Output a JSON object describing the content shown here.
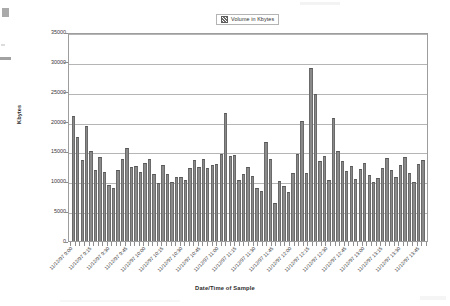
{
  "legend": {
    "label": "Volume in Kbytes",
    "swatch_icon": "hatched-square-swatch",
    "position": "top-center"
  },
  "axis": {
    "y_title": "Kbytes",
    "x_title": "Date/Time of Sample"
  },
  "colors": {
    "bar_fill": "#8a8a8a",
    "bar_outline": "#6a6a6a",
    "gridline": "#a8a8a8",
    "plot_border": "#9d9d9d",
    "background": "#ffffff",
    "text": "#333333"
  },
  "chart_data": {
    "type": "bar",
    "title": "",
    "subtitle": "",
    "xlabel": "Date/Time of Sample",
    "ylabel": "Kbytes",
    "ylim": [
      0,
      35000
    ],
    "ytick_labels": [
      "0",
      "5000",
      "10000",
      "15000",
      "20000",
      "25000",
      "30000",
      "35000"
    ],
    "ytick_values": [
      0,
      5000,
      10000,
      15000,
      20000,
      25000,
      30000,
      35000
    ],
    "grid": true,
    "legend": [
      "Volume in Kbytes"
    ],
    "legend_position": "top-center",
    "xtick_labels": [
      "11/12/97 9:00",
      "11/12/97 9:15",
      "11/12/97 9:30",
      "11/12/97 9:45",
      "11/12/97 10:00",
      "11/12/97 10:15",
      "11/12/97 10:30",
      "11/12/97 10:45",
      "11/12/97 11:00",
      "11/12/97 11:15",
      "11/12/97 11:30",
      "11/12/97 11:45",
      "11/12/97 12:00",
      "11/12/97 12:15",
      "11/12/97 12:30",
      "11/12/97 12:45",
      "11/12/97 13:00",
      "11/12/97 13:15",
      "11/12/97 13:30",
      "11/12/97 13:45"
    ],
    "xtick_every_n_bars": 4,
    "categories": [
      "11/12/97 9:00",
      "11/12/97 9:05",
      "11/12/97 9:10",
      "11/12/97 9:15",
      "11/12/97 9:20",
      "11/12/97 9:25",
      "11/12/97 9:30",
      "11/12/97 9:35",
      "11/12/97 9:40",
      "11/12/97 9:45",
      "11/12/97 9:50",
      "11/12/97 9:55",
      "11/12/97 10:00",
      "11/12/97 10:05",
      "11/12/97 10:10",
      "11/12/97 10:15",
      "11/12/97 10:20",
      "11/12/97 10:25",
      "11/12/97 10:30",
      "11/12/97 10:35",
      "11/12/97 10:40",
      "11/12/97 10:45",
      "11/12/97 10:50",
      "11/12/97 10:55",
      "11/12/97 11:00",
      "11/12/97 11:05",
      "11/12/97 11:10",
      "11/12/97 11:15",
      "11/12/97 11:20",
      "11/12/97 11:25",
      "11/12/97 11:30",
      "11/12/97 11:35",
      "11/12/97 11:40",
      "11/12/97 11:45",
      "11/12/97 11:50",
      "11/12/97 11:55",
      "11/12/97 12:00",
      "11/12/97 12:05",
      "11/12/97 12:10",
      "11/12/97 12:15",
      "11/12/97 12:20",
      "11/12/97 12:25",
      "11/12/97 12:30",
      "11/12/97 12:35",
      "11/12/97 12:40",
      "11/12/97 12:45",
      "11/12/97 12:50",
      "11/12/97 12:55",
      "11/12/97 13:00",
      "11/12/97 13:05",
      "11/12/97 13:10",
      "11/12/97 13:15",
      "11/12/97 13:20",
      "11/12/97 13:25",
      "11/12/97 13:30",
      "11/12/97 13:35",
      "11/12/97 13:40",
      "11/12/97 13:45",
      "11/12/97 13:50",
      "11/12/97 13:55",
      "11/12/97 14:00",
      "11/12/97 14:05",
      "11/12/97 14:10",
      "11/12/97 14:15",
      "11/12/97 14:20",
      "11/12/97 14:25",
      "11/12/97 14:30",
      "11/12/97 14:35",
      "11/12/97 14:40",
      "11/12/97 14:45",
      "11/12/97 14:50",
      "11/12/97 14:55",
      "11/12/97 15:00",
      "11/12/97 15:05",
      "11/12/97 15:10",
      "11/12/97 15:15",
      "11/12/97 15:20",
      "11/12/97 15:25",
      "11/12/97 15:30"
    ],
    "values": [
      21000,
      17500,
      13550,
      19300,
      15000,
      11850,
      14100,
      11500,
      9300,
      8900,
      11900,
      13800,
      15650,
      12400,
      12550,
      11600,
      13050,
      13800,
      11200,
      9650,
      12750,
      11300,
      9900,
      10700,
      10800,
      10300,
      12150,
      13650,
      12400,
      13700,
      12200,
      12800,
      12900,
      14550,
      21400,
      14250,
      14400,
      10200,
      11150,
      12350,
      10950,
      8950,
      8350,
      16500,
      13700,
      6400,
      10100,
      9250,
      8200,
      11400,
      14550,
      20150,
      11350,
      28900,
      24700,
      13450,
      14300,
      10250,
      20650,
      15050,
      13350,
      11700,
      12500,
      10400,
      12000,
      13100,
      11050,
      9800,
      10600,
      12250,
      13900,
      11900,
      10750,
      12650,
      14050,
      11450,
      9950,
      12900,
      13500
    ],
    "series": [
      {
        "name": "Volume in Kbytes",
        "values": [
          21000,
          17500,
          13550,
          19300,
          15000,
          11850,
          14100,
          11500,
          9300,
          8900,
          11900,
          13800,
          15650,
          12400,
          12550,
          11600,
          13050,
          13800,
          11200,
          9650,
          12750,
          11300,
          9900,
          10700,
          10800,
          10300,
          12150,
          13650,
          12400,
          13700,
          12200,
          12800,
          12900,
          14550,
          21400,
          14250,
          14400,
          10200,
          11150,
          12350,
          10950,
          8950,
          8350,
          16500,
          13700,
          6400,
          10100,
          9250,
          8200,
          11400,
          14550,
          20150,
          11350,
          28900,
          24700,
          13450,
          14300,
          10250,
          20650,
          15050,
          13350,
          11700,
          12500,
          10400,
          12000,
          13100,
          11050,
          9800,
          10600,
          12250,
          13900,
          11900,
          10750,
          12650,
          14050,
          11450,
          9950,
          12900,
          13500
        ]
      }
    ],
    "notes": {
      "max_value": 28900,
      "min_value": 6400,
      "bar_count": 79,
      "sample_interval": "5 minutes"
    }
  }
}
